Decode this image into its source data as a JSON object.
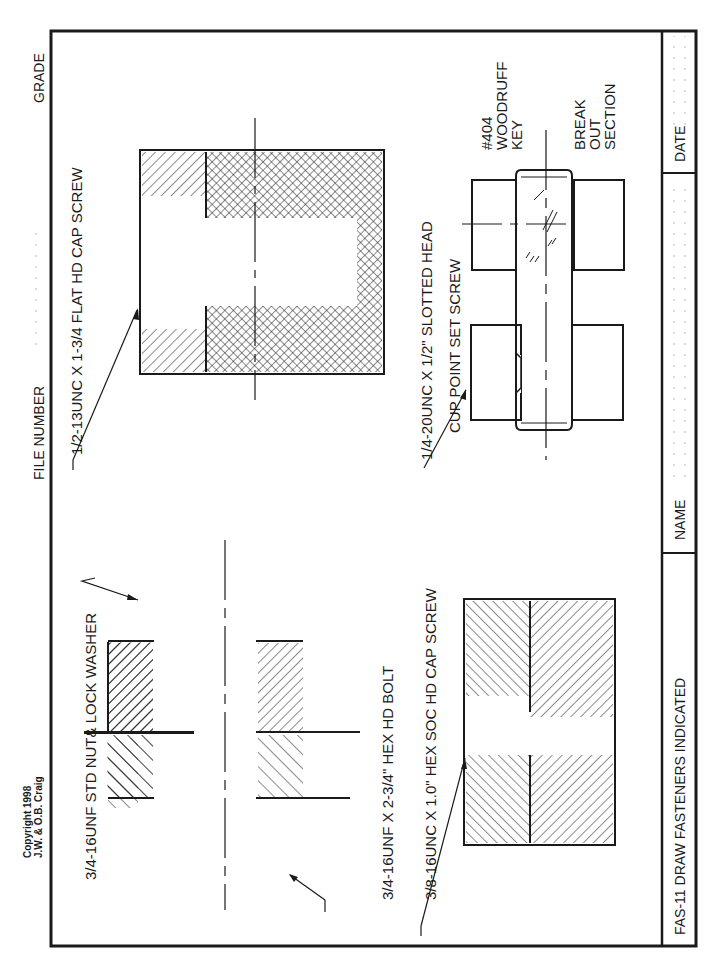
{
  "header": {
    "grade_label": "GRADE",
    "file_number_label": "FILE NUMBER",
    "copyright_line1": "Copyright 1998",
    "copyright_line2": "J.W. & O.B. Craig"
  },
  "title_block": {
    "title": "FAS-11 DRAW FASTENERS INDICATED",
    "name_label": "NAME",
    "date_label": "DATE"
  },
  "callouts": {
    "nut_washer": "3/4-16UNF STD NUT& LOCK WASHER",
    "hex_bolt": "3/4-16UNF X 2-3/4\" HEX HD BOLT",
    "socket_screw": "3/8-16UNC X 1.0\" HEX SOC HD CAP SCREW",
    "flat_head": "1/2-13UNC X 1-3/4 FLAT HD CAP SCREW",
    "set_screw_line1": "1/4-20UNC X 1/2\" SLOTTED HEAD",
    "set_screw_line2": "CUP POINT SET SCREW",
    "woodruff_line1": "#404",
    "woodruff_line2": "WOODRUFF",
    "woodruff_line3": "KEY",
    "breakout_line1": "BREAK",
    "breakout_line2": "OUT",
    "breakout_line3": "SECTION"
  },
  "colors": {
    "ink": "#1a1a1a",
    "paper": "#ffffff",
    "dots": "#9a9a9a"
  }
}
